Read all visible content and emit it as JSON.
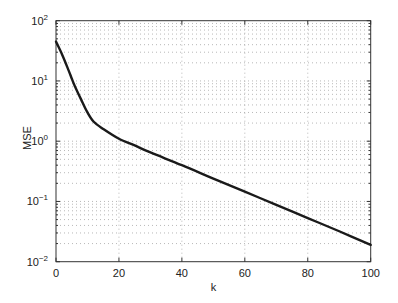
{
  "chart_data": {
    "type": "line",
    "title": "",
    "xlabel": "k",
    "ylabel": "MSE",
    "xlim": [
      0,
      100
    ],
    "ylim": [
      0.01,
      100
    ],
    "yscale": "log",
    "grid": true,
    "x_ticks": [
      0,
      20,
      40,
      60,
      80,
      100
    ],
    "x_tick_labels": [
      "0",
      "20",
      "40",
      "60",
      "80",
      "100"
    ],
    "y_ticks": [
      0.01,
      0.1,
      1,
      10,
      100
    ],
    "y_tick_labels": [
      {
        "base": "10",
        "exp": "−2"
      },
      {
        "base": "10",
        "exp": "−1"
      },
      {
        "base": "10",
        "exp": "0"
      },
      {
        "base": "10",
        "exp": "1"
      },
      {
        "base": "10",
        "exp": "2"
      }
    ],
    "series": [
      {
        "name": "MSE",
        "color": "#1a1a1a",
        "x": [
          0,
          2,
          4,
          5,
          6,
          8,
          10,
          12,
          15,
          20,
          25,
          30,
          40,
          50,
          60,
          70,
          80,
          90,
          100
        ],
        "values": [
          45,
          27,
          15,
          11,
          8.2,
          4.9,
          3.0,
          2.1,
          1.6,
          1.1,
          0.85,
          0.65,
          0.4,
          0.24,
          0.145,
          0.088,
          0.053,
          0.032,
          0.019
        ]
      }
    ],
    "legend": null
  }
}
